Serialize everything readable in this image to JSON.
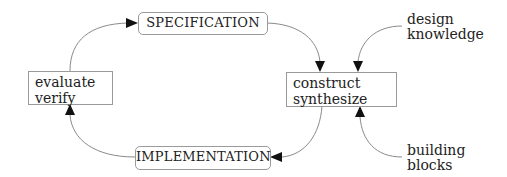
{
  "diagram": {
    "nodes": {
      "specification": {
        "label": "SPECIFICATION"
      },
      "evaluate": {
        "lines": [
          "evaluate",
          "verify"
        ]
      },
      "construct": {
        "lines": [
          "construct",
          "synthesize"
        ]
      },
      "implementation": {
        "label": "IMPLEMENTATION"
      }
    },
    "inputs": {
      "design_knowledge": {
        "lines": [
          "design",
          "knowledge"
        ]
      },
      "building_blocks": {
        "lines": [
          "building",
          "blocks"
        ]
      }
    },
    "edges": [
      {
        "from": "evaluate",
        "to": "specification"
      },
      {
        "from": "specification",
        "to": "construct"
      },
      {
        "from": "design_knowledge",
        "to": "construct"
      },
      {
        "from": "building_blocks",
        "to": "construct"
      },
      {
        "from": "construct",
        "to": "implementation"
      },
      {
        "from": "implementation",
        "to": "evaluate"
      }
    ],
    "colors": {
      "line": "#8a8a8a",
      "arrow": "#111111",
      "border": "#9a9a9a"
    }
  }
}
